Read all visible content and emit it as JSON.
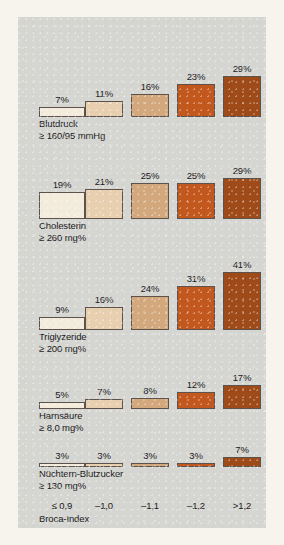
{
  "colors": {
    "page_background": "#f6f4ec",
    "panel_background": "#d5d5d2",
    "bar_outline": "#5d534c",
    "text": "#1b1b1b",
    "series_colors": [
      "#f3ecdd",
      "#e8cfb0",
      "#d3a87c",
      "#c2581d",
      "#9e4a19"
    ]
  },
  "axis": {
    "title": "Broca-Index",
    "ticks": [
      "≤ 0,9",
      "–1,0",
      "–1,1",
      "–1,2",
      ">1,2"
    ]
  },
  "chart_data": {
    "type": "bar",
    "title": "",
    "xlabel": "Broca-Index",
    "ylabel": "",
    "categories": [
      "≤ 0,9",
      "–1,0",
      "–1,1",
      "–1,2",
      ">1,2"
    ],
    "ylim": [
      0,
      41
    ],
    "grid": false,
    "legend": "none",
    "value_suffix": "%",
    "series": [
      {
        "name": "Blutdruck ≥ 160/95 mmHg",
        "label_line1": "Blutdruck",
        "label_line2": "≥ 160/95 mmHg",
        "values": [
          7,
          11,
          16,
          23,
          29
        ],
        "value_labels": [
          "7%",
          "11%",
          "16%",
          "23%",
          "29%"
        ]
      },
      {
        "name": "Cholesterin ≥ 260 mg%",
        "label_line1": "Cholesterin",
        "label_line2": "≥ 260 mg%",
        "values": [
          19,
          21,
          25,
          25,
          29
        ],
        "value_labels": [
          "19%",
          "21%",
          "25%",
          "25%",
          "29%"
        ]
      },
      {
        "name": "Triglyzeride ≥ 200 mg%",
        "label_line1": "Triglyzeride",
        "label_line2": "≥ 200 mg%",
        "values": [
          9,
          16,
          24,
          31,
          41
        ],
        "value_labels": [
          "9%",
          "16%",
          "24%",
          "31%",
          "41%"
        ]
      },
      {
        "name": "Harnsäure ≥ 8,0 mg%",
        "label_line1": "Harnsäure",
        "label_line2": "≥ 8,0 mg%",
        "values": [
          5,
          7,
          8,
          12,
          17
        ],
        "value_labels": [
          "5%",
          "7%",
          "8%",
          "12%",
          "17%"
        ]
      },
      {
        "name": "Nüchtern-Blutzucker ≥ 130 mg%",
        "label_line1": "Nüchtern-Blutzucker",
        "label_line2": "≥ 130 mg%",
        "values": [
          3,
          3,
          3,
          3,
          7
        ],
        "value_labels": [
          "3%",
          "3%",
          "3%",
          "3%",
          "7%"
        ]
      }
    ]
  }
}
